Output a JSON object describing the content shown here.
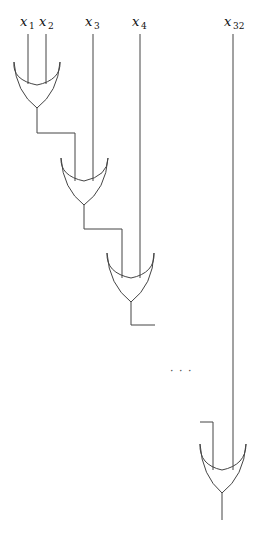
{
  "diagram": {
    "inputs": [
      {
        "var": "x",
        "sub": "1"
      },
      {
        "var": "x",
        "sub": "2"
      },
      {
        "var": "x",
        "sub": "3"
      },
      {
        "var": "x",
        "sub": "4"
      },
      {
        "var": "x",
        "sub": "32"
      }
    ],
    "gates": [
      {
        "type": "OR",
        "inputs": [
          "x1",
          "x2"
        ]
      },
      {
        "type": "OR",
        "inputs": [
          "gate1",
          "x3"
        ]
      },
      {
        "type": "OR",
        "inputs": [
          "gate2",
          "x4"
        ]
      },
      {
        "type": "OR",
        "inputs": [
          "gate31",
          "x32"
        ]
      }
    ],
    "ellipsis": "· · ·",
    "colors": {
      "line": "#444444",
      "text": "#111111",
      "background": "#ffffff"
    }
  }
}
